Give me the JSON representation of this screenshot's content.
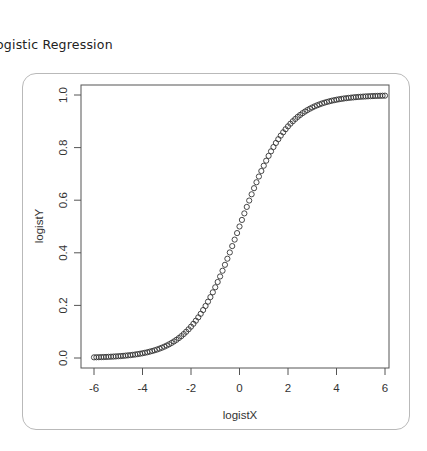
{
  "page": {
    "title": "ogistic Regression"
  },
  "chart_data": {
    "type": "scatter",
    "title": "",
    "xlabel": "logistX",
    "ylabel": "logistY",
    "xlim": [
      -6.25,
      6.25
    ],
    "ylim": [
      -0.04,
      1.04
    ],
    "xticks": [
      -6,
      -4,
      -2,
      0,
      2,
      4,
      6
    ],
    "xtick_labels": [
      "-6",
      "-4",
      "-2",
      "0",
      "2",
      "4",
      "6"
    ],
    "yticks": [
      0.0,
      0.2,
      0.4,
      0.6,
      0.8,
      1.0
    ],
    "ytick_labels": [
      "0.0",
      "0.2",
      "0.4",
      "0.6",
      "0.8",
      "1.0"
    ],
    "grid": false,
    "legend": null,
    "marker": "open-circle",
    "marker_color": "#333333",
    "function": "y = 1 / (1 + exp(-x))",
    "x_start": -6,
    "x_end": 6,
    "x_step": 0.1,
    "n_points": 121,
    "sample_points": [
      {
        "x": -6,
        "y": 0.0025
      },
      {
        "x": -5,
        "y": 0.0067
      },
      {
        "x": -4,
        "y": 0.018
      },
      {
        "x": -3,
        "y": 0.047
      },
      {
        "x": -2,
        "y": 0.119
      },
      {
        "x": -1,
        "y": 0.269
      },
      {
        "x": 0,
        "y": 0.5
      },
      {
        "x": 1,
        "y": 0.731
      },
      {
        "x": 2,
        "y": 0.881
      },
      {
        "x": 3,
        "y": 0.953
      },
      {
        "x": 4,
        "y": 0.982
      },
      {
        "x": 5,
        "y": 0.9933
      },
      {
        "x": 6,
        "y": 0.9975
      }
    ]
  }
}
